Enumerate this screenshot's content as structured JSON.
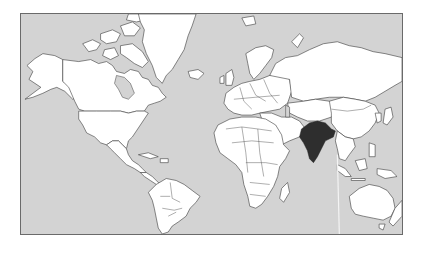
{
  "map": {
    "projection": "mercator",
    "region": "world",
    "highlighted_country": "India",
    "colors": {
      "ocean": "#d3d3d3",
      "land": "#ffffff",
      "borders": "#3a3a3a",
      "highlight": "#2e2e2e",
      "frame": "#6a6a6a"
    }
  }
}
